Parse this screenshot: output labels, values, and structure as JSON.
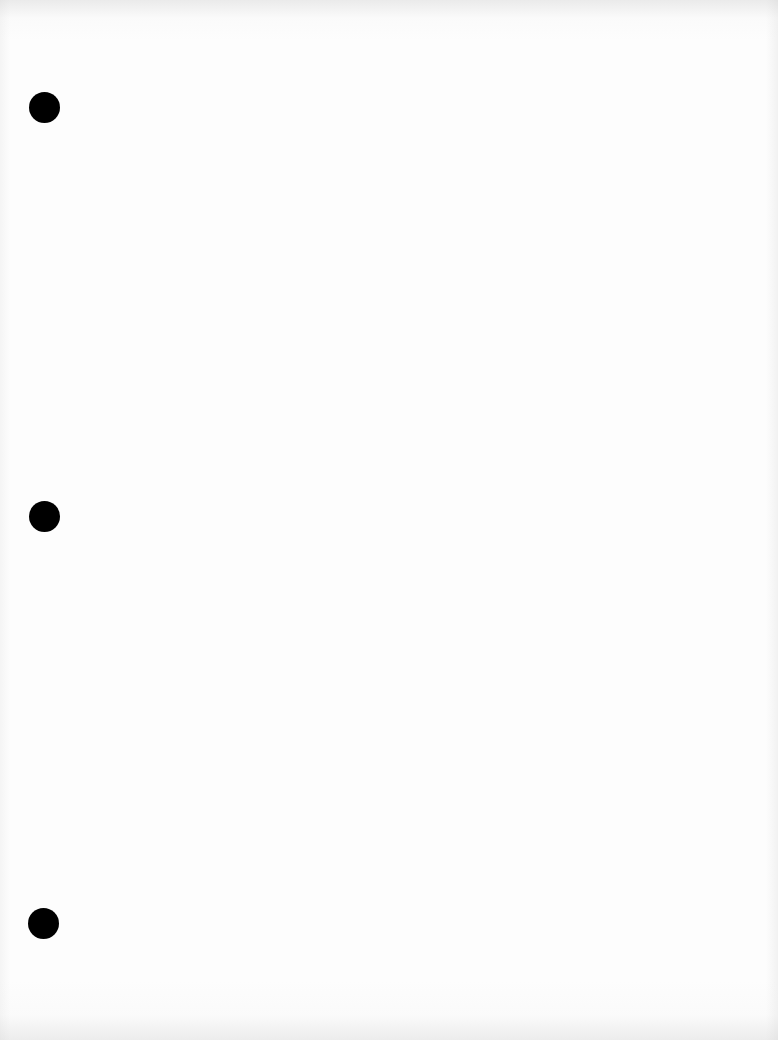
{
  "document": {
    "type": "blank scanned page",
    "text": "",
    "background_color": "#fdfdfd",
    "punch_holes": [
      {
        "cx": 44,
        "cy": 107,
        "diameter": 31,
        "color": "#000000"
      },
      {
        "cx": 44,
        "cy": 516,
        "diameter": 31,
        "color": "#000000"
      },
      {
        "cx": 43,
        "cy": 923,
        "diameter": 31,
        "color": "#000000"
      }
    ]
  }
}
